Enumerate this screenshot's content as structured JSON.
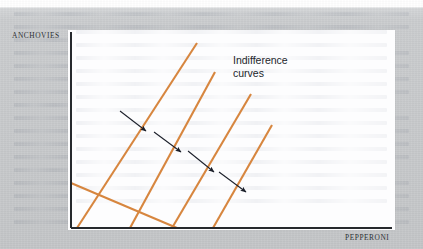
{
  "figure": {
    "type": "indifference-curve-diagram",
    "axes": {
      "y_label": "ANCHOVIES",
      "x_label": "PEPPERONI",
      "axis_color": "#26292d",
      "origin_px": [
        71,
        228
      ],
      "y_axis_top_px": [
        71,
        32
      ],
      "x_axis_right_px": [
        392,
        228
      ]
    },
    "annotation": {
      "text": "Indifference\ncurves",
      "color": "#23262b"
    },
    "curve_color": "#d7863f",
    "arrow_color": "#1b1f2a",
    "background_color": "#c6c8ca",
    "panel_color": "#fdfdfe",
    "curves": [
      {
        "name": "indifference-curve-1",
        "x1": 71,
        "y1": 183,
        "x2": 177,
        "y2": 228
      },
      {
        "name": "indifference-curve-2",
        "x1": 77,
        "y1": 228,
        "x2": 197,
        "y2": 43
      },
      {
        "name": "indifference-curve-3",
        "x1": 130,
        "y1": 228,
        "x2": 215,
        "y2": 72
      },
      {
        "name": "indifference-curve-4",
        "x1": 172,
        "y1": 228,
        "x2": 251,
        "y2": 94
      },
      {
        "name": "indifference-curve-5",
        "x1": 213,
        "y1": 228,
        "x2": 272,
        "y2": 125
      }
    ],
    "arrows": [
      {
        "name": "utility-arrow-1",
        "x1": 120,
        "y1": 111,
        "x2": 146,
        "y2": 131
      },
      {
        "name": "utility-arrow-2",
        "x1": 154,
        "y1": 132,
        "x2": 181,
        "y2": 152
      },
      {
        "name": "utility-arrow-3",
        "x1": 188,
        "y1": 151,
        "x2": 214,
        "y2": 172
      },
      {
        "name": "utility-arrow-4",
        "x1": 219,
        "y1": 172,
        "x2": 246,
        "y2": 192
      }
    ],
    "showthrough_line_count": 17,
    "panel_showthrough_line_count": 14
  },
  "chart_data": {
    "type": "line",
    "title": "",
    "xlabel": "PEPPERONI",
    "ylabel": "ANCHOVIES",
    "legend": [],
    "annotations": [
      "Indifference curves"
    ],
    "grid": false,
    "axis_ticks": [],
    "series": [
      {
        "name": "indifference-curve-1",
        "x": [
          71,
          177
        ],
        "y": [
          183,
          228
        ]
      },
      {
        "name": "indifference-curve-2",
        "x": [
          77,
          197
        ],
        "y": [
          228,
          43
        ]
      },
      {
        "name": "indifference-curve-3",
        "x": [
          130,
          215
        ],
        "y": [
          228,
          72
        ]
      },
      {
        "name": "indifference-curve-4",
        "x": [
          172,
          251
        ],
        "y": [
          228,
          94
        ]
      },
      {
        "name": "indifference-curve-5",
        "x": [
          213,
          272
        ],
        "y": [
          228,
          125
        ]
      }
    ],
    "xlim": [
      71,
      392
    ],
    "ylim": [
      228,
      32
    ]
  }
}
